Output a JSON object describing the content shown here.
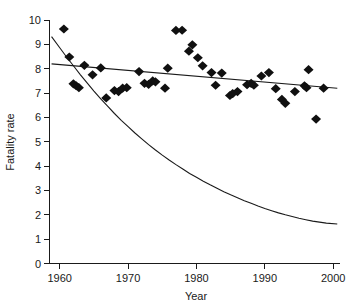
{
  "chart_data": {
    "type": "scatter",
    "title": "",
    "subtitle": "",
    "xlabel": "Year",
    "ylabel": "Fatality rate",
    "xlim": [
      1958.5,
      2001
    ],
    "ylim": [
      0,
      10
    ],
    "xticks": [
      1960,
      1970,
      1980,
      1990,
      2000
    ],
    "xtick_labels": [
      "1960",
      "1970",
      "1980",
      "1990",
      "2000"
    ],
    "yticks": [
      0,
      1,
      2,
      3,
      4,
      5,
      6,
      7,
      8,
      9,
      10
    ],
    "ytick_labels": [
      "0",
      "1",
      "2",
      "3",
      "4",
      "5",
      "6",
      "7",
      "8",
      "9",
      "10"
    ],
    "grid": false,
    "legend": "none",
    "marker_style": "filled-diamond",
    "marker_color": "#101010",
    "line_color": "#1a1a1a",
    "points": [
      {
        "x": 1960.6,
        "y": 9.63
      },
      {
        "x": 1961.4,
        "y": 8.48
      },
      {
        "x": 1962.0,
        "y": 7.38
      },
      {
        "x": 1962.4,
        "y": 7.3
      },
      {
        "x": 1962.8,
        "y": 7.22
      },
      {
        "x": 1963.6,
        "y": 8.14
      },
      {
        "x": 1964.8,
        "y": 7.75
      },
      {
        "x": 1966.0,
        "y": 8.03
      },
      {
        "x": 1966.8,
        "y": 6.8
      },
      {
        "x": 1968.0,
        "y": 7.1
      },
      {
        "x": 1968.6,
        "y": 7.06
      },
      {
        "x": 1969.2,
        "y": 7.2
      },
      {
        "x": 1969.8,
        "y": 7.22
      },
      {
        "x": 1971.6,
        "y": 7.88
      },
      {
        "x": 1972.4,
        "y": 7.4
      },
      {
        "x": 1973.0,
        "y": 7.36
      },
      {
        "x": 1973.6,
        "y": 7.5
      },
      {
        "x": 1974.0,
        "y": 7.46
      },
      {
        "x": 1975.4,
        "y": 7.2
      },
      {
        "x": 1975.8,
        "y": 8.02
      },
      {
        "x": 1977.0,
        "y": 9.57
      },
      {
        "x": 1977.9,
        "y": 9.58
      },
      {
        "x": 1978.9,
        "y": 8.72
      },
      {
        "x": 1979.4,
        "y": 8.98
      },
      {
        "x": 1980.2,
        "y": 8.45
      },
      {
        "x": 1980.9,
        "y": 8.12
      },
      {
        "x": 1982.2,
        "y": 7.84
      },
      {
        "x": 1982.8,
        "y": 7.32
      },
      {
        "x": 1983.7,
        "y": 7.82
      },
      {
        "x": 1984.9,
        "y": 6.9
      },
      {
        "x": 1985.3,
        "y": 6.98
      },
      {
        "x": 1986.0,
        "y": 7.06
      },
      {
        "x": 1987.4,
        "y": 7.34
      },
      {
        "x": 1988.0,
        "y": 7.4
      },
      {
        "x": 1988.4,
        "y": 7.32
      },
      {
        "x": 1989.5,
        "y": 7.7
      },
      {
        "x": 1990.6,
        "y": 7.84
      },
      {
        "x": 1991.6,
        "y": 7.18
      },
      {
        "x": 1992.5,
        "y": 6.74
      },
      {
        "x": 1993.0,
        "y": 6.58
      },
      {
        "x": 1994.4,
        "y": 7.06
      },
      {
        "x": 1995.8,
        "y": 7.3
      },
      {
        "x": 1996.1,
        "y": 7.22
      },
      {
        "x": 1996.4,
        "y": 7.96
      },
      {
        "x": 1997.5,
        "y": 5.93
      },
      {
        "x": 1998.6,
        "y": 7.2
      }
    ],
    "fit_line": {
      "name": "linear-trend",
      "points": [
        {
          "x": 1958.8,
          "y": 8.2
        },
        {
          "x": 2000.6,
          "y": 7.2
        }
      ]
    },
    "fit_curve": {
      "name": "exponential-decay",
      "points": [
        {
          "x": 1958.8,
          "y": 9.32
        },
        {
          "x": 1960.0,
          "y": 8.86
        },
        {
          "x": 1961.0,
          "y": 8.48
        },
        {
          "x": 1962.0,
          "y": 8.12
        },
        {
          "x": 1963.0,
          "y": 7.76
        },
        {
          "x": 1964.0,
          "y": 7.42
        },
        {
          "x": 1965.0,
          "y": 7.08
        },
        {
          "x": 1966.0,
          "y": 6.76
        },
        {
          "x": 1967.0,
          "y": 6.46
        },
        {
          "x": 1968.0,
          "y": 6.16
        },
        {
          "x": 1969.0,
          "y": 5.88
        },
        {
          "x": 1970.0,
          "y": 5.62
        },
        {
          "x": 1971.0,
          "y": 5.36
        },
        {
          "x": 1972.0,
          "y": 5.12
        },
        {
          "x": 1973.0,
          "y": 4.88
        },
        {
          "x": 1974.0,
          "y": 4.66
        },
        {
          "x": 1975.0,
          "y": 4.45
        },
        {
          "x": 1976.0,
          "y": 4.25
        },
        {
          "x": 1977.0,
          "y": 4.06
        },
        {
          "x": 1978.0,
          "y": 3.88
        },
        {
          "x": 1979.0,
          "y": 3.7
        },
        {
          "x": 1980.0,
          "y": 3.54
        },
        {
          "x": 1981.0,
          "y": 3.38
        },
        {
          "x": 1982.0,
          "y": 3.23
        },
        {
          "x": 1983.0,
          "y": 3.09
        },
        {
          "x": 1984.0,
          "y": 2.95
        },
        {
          "x": 1985.0,
          "y": 2.82
        },
        {
          "x": 1986.0,
          "y": 2.7
        },
        {
          "x": 1987.0,
          "y": 2.58
        },
        {
          "x": 1988.0,
          "y": 2.47
        },
        {
          "x": 1989.0,
          "y": 2.36
        },
        {
          "x": 1990.0,
          "y": 2.26
        },
        {
          "x": 1991.0,
          "y": 2.17
        },
        {
          "x": 1992.0,
          "y": 2.08
        },
        {
          "x": 1993.0,
          "y": 2.0
        },
        {
          "x": 1994.0,
          "y": 1.93
        },
        {
          "x": 1995.0,
          "y": 1.86
        },
        {
          "x": 1996.0,
          "y": 1.8
        },
        {
          "x": 1997.0,
          "y": 1.74
        },
        {
          "x": 1998.0,
          "y": 1.7
        },
        {
          "x": 1999.0,
          "y": 1.66
        },
        {
          "x": 2000.6,
          "y": 1.62
        }
      ]
    }
  }
}
